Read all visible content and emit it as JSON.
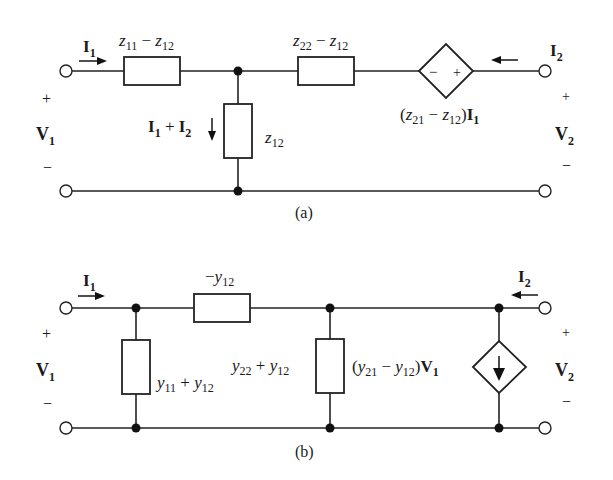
{
  "figure": {
    "caption_a": "(a)",
    "caption_b": "(b)"
  },
  "circuit_a": {
    "title": "Z-parameter T-equivalent circuit",
    "port1": {
      "current": "I",
      "current_sub": "1",
      "voltage": "V",
      "voltage_sub": "1",
      "plus": "+",
      "minus": "−"
    },
    "port2": {
      "current": "I",
      "current_sub": "2",
      "voltage": "V",
      "voltage_sub": "2",
      "plus": "+",
      "minus": "−"
    },
    "series_left": {
      "label_parts": [
        "z",
        "11",
        " − ",
        "z",
        "12"
      ]
    },
    "series_right": {
      "label_parts": [
        "z",
        "22",
        " − ",
        "z",
        "12"
      ]
    },
    "shunt": {
      "label_parts": [
        "z",
        "12"
      ],
      "current_label_parts": [
        "I",
        "1",
        " + ",
        "I",
        "2"
      ]
    },
    "dependent_source": {
      "type": "voltage",
      "minus": "−",
      "plus": "+",
      "label_parts": [
        "(",
        "z",
        "21",
        " − ",
        "z",
        "12",
        ")",
        "I",
        "1"
      ]
    }
  },
  "circuit_b": {
    "title": "Y-parameter Π-equivalent circuit",
    "port1": {
      "current": "I",
      "current_sub": "1",
      "voltage": "V",
      "voltage_sub": "1",
      "plus": "+",
      "minus": "−"
    },
    "port2": {
      "current": "I",
      "current_sub": "2",
      "voltage": "V",
      "voltage_sub": "2",
      "plus": "+",
      "minus": "−"
    },
    "series": {
      "label_parts": [
        "−",
        "y",
        "12"
      ]
    },
    "shunt_left": {
      "label_parts": [
        "y",
        "11",
        " + ",
        "y",
        "12"
      ]
    },
    "shunt_right": {
      "label_parts": [
        "y",
        "22",
        " + ",
        "y",
        "12"
      ]
    },
    "dependent_source": {
      "type": "current",
      "label_parts": [
        "(",
        "y",
        "21",
        " − ",
        "y",
        "12",
        ")",
        "V",
        "1"
      ]
    }
  }
}
